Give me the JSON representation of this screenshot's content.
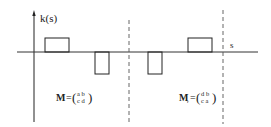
{
  "diagram": {
    "y_axis_label": "k(s)",
    "x_axis_label": "s",
    "colors": {
      "stroke": "#222222",
      "dashed": "#555555",
      "background": "#ffffff"
    },
    "pulses": [
      {
        "id": "pulse-1",
        "sign": "positive"
      },
      {
        "id": "pulse-2",
        "sign": "negative"
      },
      {
        "id": "pulse-3",
        "sign": "negative"
      },
      {
        "id": "pulse-4",
        "sign": "positive"
      }
    ],
    "matrix_left": {
      "name": "M",
      "subscript": "",
      "equals": "=",
      "row1": "a b",
      "row2": "c d"
    },
    "matrix_right": {
      "name": "M",
      "subscript": "r",
      "equals": "=",
      "row1": "d b",
      "row2": "c a"
    }
  }
}
